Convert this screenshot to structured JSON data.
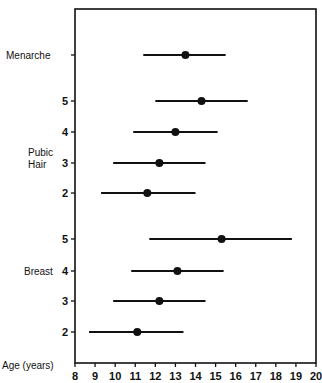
{
  "chart_data": {
    "type": "range",
    "title": "",
    "xlabel": "Age (years)",
    "ylabel": "",
    "xlim": [
      8,
      20
    ],
    "xticks": [
      8,
      9,
      10,
      11,
      12,
      13,
      14,
      15,
      16,
      17,
      18,
      19,
      20
    ],
    "groups": [
      {
        "name": "Menarche",
        "items": [
          {
            "label": "",
            "y": 55,
            "low": 11.4,
            "mean": 13.5,
            "high": 15.5
          }
        ]
      },
      {
        "name": "Pubic Hair",
        "items": [
          {
            "label": "5",
            "y": 101,
            "low": 12.0,
            "mean": 14.3,
            "high": 16.6
          },
          {
            "label": "4",
            "y": 132,
            "low": 10.9,
            "mean": 13.0,
            "high": 15.1
          },
          {
            "label": "3",
            "y": 163,
            "low": 9.9,
            "mean": 12.2,
            "high": 14.5
          },
          {
            "label": "2",
            "y": 193,
            "low": 9.3,
            "mean": 11.6,
            "high": 14.0
          }
        ]
      },
      {
        "name": "Breast",
        "items": [
          {
            "label": "5",
            "y": 239,
            "low": 11.7,
            "mean": 15.3,
            "high": 18.8
          },
          {
            "label": "4",
            "y": 271,
            "low": 10.8,
            "mean": 13.1,
            "high": 15.4
          },
          {
            "label": "3",
            "y": 301,
            "low": 9.9,
            "mean": 12.2,
            "high": 14.5
          },
          {
            "label": "2",
            "y": 332,
            "low": 8.7,
            "mean": 11.1,
            "high": 13.4
          }
        ]
      }
    ]
  },
  "labels": {
    "menarche": "Menarche",
    "pubic1": "Pubic",
    "pubic2": "Hair",
    "breast": "Breast",
    "age": "Age (years)"
  }
}
